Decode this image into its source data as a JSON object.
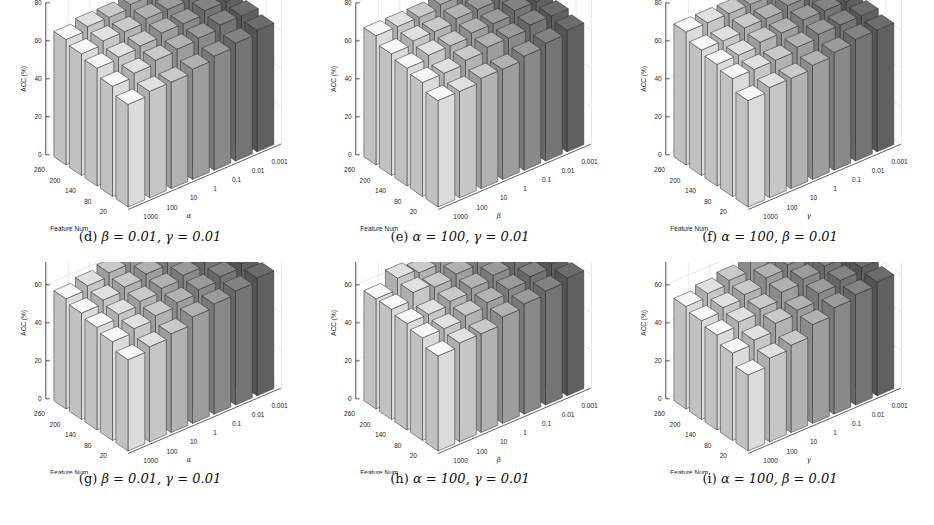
{
  "figure": {
    "panels_order": [
      "d",
      "e",
      "f",
      "g",
      "h",
      "i"
    ]
  },
  "chart_data": [
    {
      "id": "d",
      "type": "bar3d",
      "caption_label": "(d)",
      "caption_math": "β = 0.01, γ = 0.01",
      "title": "(d) β = 0.01, γ = 0.01",
      "zlabel": "ACC (%)",
      "xlabel": "Feature Num",
      "ylabel": "α",
      "zlim": [
        0,
        80
      ],
      "zticks": [
        0,
        20,
        40,
        60,
        80
      ],
      "feature_num": [
        20,
        80,
        140,
        200,
        260
      ],
      "param_values": [
        "1000",
        "100",
        "10",
        "1",
        "0.1",
        "0.01",
        "0.001"
      ],
      "values": [
        [
          54,
          56,
          56,
          58,
          60,
          62,
          64
        ],
        [
          58,
          60,
          62,
          63,
          64,
          66,
          66
        ],
        [
          62,
          63,
          64,
          66,
          66,
          68,
          68
        ],
        [
          64,
          66,
          66,
          68,
          68,
          70,
          70
        ],
        [
          66,
          68,
          68,
          70,
          70,
          72,
          72
        ]
      ]
    },
    {
      "id": "e",
      "type": "bar3d",
      "caption_label": "(e)",
      "caption_math": "α = 100, γ = 0.01",
      "title": "(e) α = 100, γ = 0.01",
      "zlabel": "ACC (%)",
      "xlabel": "Feature Num",
      "ylabel": "β",
      "zlim": [
        0,
        80
      ],
      "zticks": [
        0,
        20,
        40,
        60,
        80
      ],
      "feature_num": [
        20,
        80,
        140,
        200,
        260
      ],
      "param_values": [
        "1000",
        "100",
        "10",
        "1",
        "0.1",
        "0.01",
        "0.001"
      ],
      "values": [
        [
          56,
          56,
          58,
          58,
          60,
          62,
          64
        ],
        [
          60,
          60,
          62,
          64,
          64,
          66,
          66
        ],
        [
          62,
          64,
          64,
          66,
          66,
          68,
          68
        ],
        [
          64,
          66,
          66,
          68,
          68,
          70,
          70
        ],
        [
          68,
          68,
          68,
          70,
          70,
          72,
          72
        ]
      ]
    },
    {
      "id": "f",
      "type": "bar3d",
      "caption_label": "(f)",
      "caption_math": "α = 100, β = 0.01",
      "title": "(f) α = 100, β = 0.01",
      "zlabel": "ACC (%)",
      "xlabel": "Feature Num",
      "ylabel": "γ",
      "zlim": [
        0,
        80
      ],
      "zticks": [
        0,
        20,
        40,
        60,
        80
      ],
      "feature_num": [
        20,
        80,
        140,
        200,
        260
      ],
      "param_values": [
        "1000",
        "100",
        "10",
        "1",
        "0.1",
        "0.01",
        "0.001"
      ],
      "values": [
        [
          56,
          58,
          58,
          60,
          62,
          64,
          64
        ],
        [
          62,
          62,
          62,
          64,
          66,
          66,
          66
        ],
        [
          64,
          64,
          66,
          66,
          68,
          68,
          68
        ],
        [
          66,
          66,
          68,
          68,
          70,
          70,
          70
        ],
        [
          70,
          70,
          70,
          70,
          72,
          72,
          72
        ]
      ]
    },
    {
      "id": "g",
      "type": "bar3d",
      "caption_label": "(g)",
      "caption_math": "β = 0.01, γ = 0.01",
      "title": "(g) β = 0.01, γ = 0.01",
      "zlabel": "ACC (%)",
      "xlabel": "Feature Num",
      "ylabel": "α",
      "zlim": [
        0,
        80
      ],
      "zticks": [
        0,
        20,
        40,
        60,
        80
      ],
      "feature_num": [
        20,
        80,
        140,
        200,
        260
      ],
      "param_values": [
        "1000",
        "100",
        "10",
        "1",
        "0.1",
        "0.01",
        "0.001"
      ],
      "values": [
        [
          48,
          50,
          52,
          56,
          58,
          60,
          62
        ],
        [
          52,
          54,
          56,
          58,
          60,
          62,
          64
        ],
        [
          54,
          56,
          58,
          60,
          62,
          64,
          64
        ],
        [
          56,
          58,
          60,
          62,
          64,
          66,
          66
        ],
        [
          58,
          60,
          62,
          64,
          64,
          66,
          68
        ]
      ]
    },
    {
      "id": "h",
      "type": "bar3d",
      "caption_label": "(h)",
      "caption_math": "α = 100, γ = 0.01",
      "title": "(h) α = 100, γ = 0.01",
      "zlabel": "ACC (%)",
      "xlabel": "Feature Num",
      "ylabel": "β",
      "zlim": [
        0,
        80
      ],
      "zticks": [
        0,
        20,
        40,
        60,
        80
      ],
      "feature_num": [
        20,
        80,
        140,
        200,
        260
      ],
      "param_values": [
        "1000",
        "100",
        "10",
        "1",
        "0.1",
        "0.01",
        "0.001"
      ],
      "values": [
        [
          50,
          52,
          52,
          56,
          58,
          60,
          62
        ],
        [
          54,
          54,
          56,
          58,
          60,
          62,
          64
        ],
        [
          56,
          56,
          58,
          60,
          62,
          64,
          64
        ],
        [
          58,
          62,
          60,
          62,
          64,
          66,
          66
        ],
        [
          58,
          64,
          62,
          64,
          64,
          66,
          68
        ]
      ]
    },
    {
      "id": "i",
      "type": "bar3d",
      "caption_label": "(i)",
      "caption_math": "α = 100, β = 0.01",
      "title": "(i) α = 100, β = 0.01",
      "zlabel": "ACC (%)",
      "xlabel": "Feature Num",
      "ylabel": "γ",
      "zlim": [
        0,
        80
      ],
      "zticks": [
        0,
        20,
        40,
        60,
        80
      ],
      "feature_num": [
        20,
        80,
        140,
        200,
        260
      ],
      "param_values": [
        "1000",
        "100",
        "10",
        "1",
        "0.1",
        "0.01",
        "0.001"
      ],
      "values": [
        [
          40,
          44,
          46,
          52,
          56,
          58,
          60
        ],
        [
          46,
          48,
          52,
          54,
          58,
          60,
          62
        ],
        [
          50,
          52,
          54,
          58,
          60,
          62,
          64
        ],
        [
          52,
          54,
          56,
          60,
          62,
          64,
          64
        ],
        [
          54,
          56,
          58,
          66,
          64,
          66,
          66
        ]
      ]
    }
  ]
}
